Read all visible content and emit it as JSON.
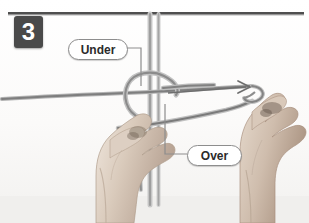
{
  "figure": {
    "type": "knot-tying-instruction-photo",
    "step_number": "3",
    "background_color": "#fdfdfc",
    "badge_color": "#4a4a4a",
    "badge_text_color": "#ffffff",
    "cord_color": "#8a8a8a",
    "skin_color": "#cfc0b4",
    "rule_color": "#4f4f4f"
  },
  "callouts": [
    {
      "id": "under",
      "label": "Under",
      "x": 68,
      "y": 39,
      "leader": "right-then-down"
    },
    {
      "id": "over",
      "label": "Over",
      "x": 187,
      "y": 145,
      "leader": "left-then-up"
    }
  ],
  "annotations": {
    "arrow": {
      "name": "pull-direction-arrow",
      "direction": "right",
      "from_x": 168,
      "from_y": 93,
      "to_x": 249,
      "to_y": 88
    }
  },
  "scene": {
    "description": "Two hands tying a knot with pale cords against a white background",
    "hands": [
      "left-hand",
      "right-hand"
    ],
    "cords": [
      "vertical-core-cord",
      "horizontal-working-cord",
      "looped-cord"
    ]
  }
}
